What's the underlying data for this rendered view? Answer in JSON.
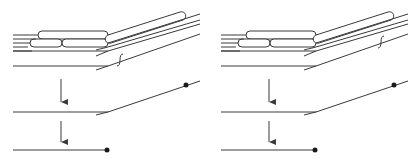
{
  "figure": {
    "panels": [
      {
        "id": "left",
        "offset_x": 0,
        "break_mark_position": "near-bend",
        "break_mark": {
          "x": 120,
          "y": 60
        }
      },
      {
        "id": "right",
        "offset_x": 208,
        "break_mark_position": "far-along-diagonal",
        "break_mark": {
          "x": 173,
          "y": 42
        }
      }
    ],
    "colors": {
      "line": "#3a3a3a",
      "dot": "#1a1a1a",
      "background": "#ffffff"
    }
  }
}
